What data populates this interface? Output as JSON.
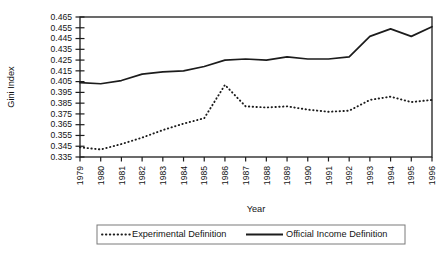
{
  "chart_data": {
    "type": "line",
    "title": "",
    "xlabel": "Year",
    "ylabel": "Gini Index",
    "grid": false,
    "legend_position": "bottom",
    "xlim": [
      1979,
      1996
    ],
    "ylim": [
      0.335,
      0.465
    ],
    "ytick_step": 0.01,
    "x": [
      1979,
      1980,
      1981,
      1982,
      1983,
      1984,
      1985,
      1986,
      1987,
      1988,
      1989,
      1990,
      1991,
      1992,
      1993,
      1994,
      1995,
      1996
    ],
    "xtick_labels": [
      "1979",
      "1980",
      "1981",
      "1982",
      "1983",
      "1984",
      "1985",
      "1986",
      "1987",
      "1988",
      "1989",
      "1990",
      "1991",
      "1992",
      "1993",
      "1994",
      "1995",
      "1996"
    ],
    "ytick_labels": [
      "0.335",
      "0.345",
      "0.355",
      "0.365",
      "0.375",
      "0.385",
      "0.395",
      "0.405",
      "0.415",
      "0.425",
      "0.435",
      "0.445",
      "0.455",
      "0.465"
    ],
    "ytick_values": [
      0.335,
      0.345,
      0.355,
      0.365,
      0.375,
      0.385,
      0.395,
      0.405,
      0.415,
      0.425,
      0.435,
      0.445,
      0.455,
      0.465
    ],
    "series": [
      {
        "name": "Experimental Definition",
        "style": "dotted",
        "color": "#1c1c1c",
        "values": [
          0.344,
          0.342,
          0.347,
          0.353,
          0.36,
          0.366,
          0.371,
          0.402,
          0.382,
          0.381,
          0.382,
          0.379,
          0.377,
          0.378,
          0.388,
          0.391,
          0.386,
          0.388
        ]
      },
      {
        "name": "Official Income Definition",
        "style": "solid",
        "color": "#1c1c1c",
        "values": [
          0.404,
          0.403,
          0.406,
          0.412,
          0.414,
          0.415,
          0.419,
          0.425,
          0.426,
          0.425,
          0.428,
          0.426,
          0.426,
          0.428,
          0.447,
          0.454,
          0.447,
          0.456
        ]
      }
    ],
    "annotations": []
  },
  "legend": {
    "items": [
      {
        "label": "Experimental Definition",
        "style": "dotted"
      },
      {
        "label": "Official Income Definition",
        "style": "solid"
      }
    ]
  },
  "axes": {
    "x_title": "Year",
    "y_title": "Gini Index"
  }
}
